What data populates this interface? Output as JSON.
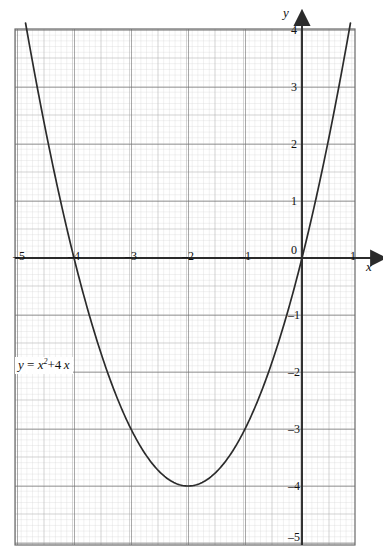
{
  "figure": {
    "equation_label": "y = x² + 4x",
    "equation_parts": {
      "lhs": "y",
      "eq": "=",
      "base": "x",
      "exp": "2",
      "plus": "+",
      "coef": "4",
      "var": "x"
    },
    "x_axis_name": "x",
    "y_axis_name": "y"
  },
  "chart_data": {
    "type": "line",
    "title": "",
    "subtitle": "",
    "xlabel": "x",
    "ylabel": "y",
    "annotations": [
      "y = x² + 4x"
    ],
    "grid": true,
    "grid_minor_step": 0.1,
    "grid_medium_step": 0.5,
    "grid_major_step": 1,
    "legend": "none",
    "xlim": [
      -5.03,
      0.93
    ],
    "ylim": [
      -5.04,
      4.02
    ],
    "xticks": [
      -5,
      -4,
      -3,
      -2,
      -1,
      0,
      1
    ],
    "yticks": [
      4,
      3,
      2,
      1,
      0,
      -1,
      -2,
      -3,
      -4,
      -5
    ],
    "xtick_labels": [
      "–5",
      "–4",
      "–3",
      "–2",
      "–1",
      "0",
      "1"
    ],
    "ytick_labels": [
      "4",
      "3",
      "2",
      "1",
      "0",
      "–1",
      "–2",
      "–3",
      "–4",
      "–5"
    ],
    "series": [
      {
        "name": "y = x² + 4x",
        "equation": "y = x^2 + 4x",
        "color": "#2b2b2b",
        "vertex": [
          -2,
          -4
        ],
        "roots": [
          -4,
          0
        ],
        "x": [
          -4.85,
          -4.75,
          -4.5,
          -4.25,
          -4,
          -3.75,
          -3.5,
          -3.25,
          -3,
          -2.75,
          -2.5,
          -2.25,
          -2,
          -1.75,
          -1.5,
          -1.25,
          -1,
          -0.75,
          -0.5,
          -0.25,
          0,
          0.25,
          0.5,
          0.75,
          0.93
        ],
        "values": [
          4.12,
          3.56,
          2.25,
          1.06,
          0,
          -0.94,
          -1.75,
          -2.44,
          -3,
          -3.44,
          -3.75,
          -3.94,
          -4,
          -3.94,
          -3.75,
          -3.44,
          -3,
          -2.44,
          -1.75,
          -0.94,
          0,
          1.06,
          2.25,
          3.56,
          4.59
        ]
      }
    ]
  },
  "colors": {
    "curve": "#2b2b2b",
    "axis": "#2b2b2b",
    "grid_major": "#5a5a5a",
    "grid_medium": "#9a9a9a",
    "grid_minor": "#c9c9c9",
    "background": "#ffffff"
  }
}
